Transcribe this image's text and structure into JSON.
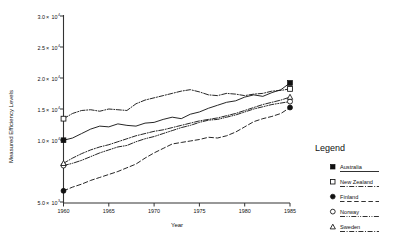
{
  "chart_data": {
    "type": "line",
    "title": "",
    "xlabel": "Year",
    "ylabel": "Measured Efficiency Levels",
    "xlim": [
      1960,
      1985
    ],
    "ylim": [
      5000,
      30000
    ],
    "grid": false,
    "legend_position": "right-outside",
    "legend_title": "Legend",
    "xticks": [
      "1960",
      "1965",
      "1970",
      "1975",
      "1980",
      "1985"
    ],
    "xtick_values": [
      1960,
      1965,
      1970,
      1975,
      1980,
      1985
    ],
    "yticks": [
      {
        "mantissa": "3.0",
        "times": "×",
        "base": "10",
        "exp": "4",
        "value": 30000
      },
      {
        "mantissa": "2.5",
        "times": "×",
        "base": "10",
        "exp": "4",
        "value": 25000
      },
      {
        "mantissa": "2.0",
        "times": "×",
        "base": "10",
        "exp": "4",
        "value": 20000
      },
      {
        "mantissa": "1.5",
        "times": "×",
        "base": "10",
        "exp": "4",
        "value": 15000
      },
      {
        "mantissa": "1.0",
        "times": "×",
        "base": "10",
        "exp": "4",
        "value": 10000
      },
      {
        "mantissa": "5.0",
        "times": "×",
        "base": "10",
        "exp": "3",
        "value": 5000
      }
    ],
    "x": [
      1960,
      1961,
      1962,
      1963,
      1964,
      1965,
      1966,
      1967,
      1968,
      1969,
      1970,
      1971,
      1972,
      1973,
      1974,
      1975,
      1976,
      1977,
      1978,
      1979,
      1980,
      1981,
      1982,
      1983,
      1984,
      1985
    ],
    "series": [
      {
        "name": "Australia",
        "marker": "filled-square",
        "linestyle": "solid",
        "color": "#1a1a1a",
        "values": [
          13300,
          13600,
          14200,
          14800,
          15200,
          15100,
          15500,
          15300,
          15200,
          15600,
          15700,
          16100,
          16400,
          16200,
          16800,
          17100,
          17600,
          18000,
          18400,
          18600,
          19100,
          19400,
          19200,
          19700,
          20100,
          21000
        ]
      },
      {
        "name": "New Zealand",
        "marker": "open-square",
        "linestyle": "dash-dot",
        "color": "#1a1a1a",
        "values": [
          16200,
          16900,
          17300,
          17400,
          17200,
          17500,
          17400,
          17300,
          18200,
          18700,
          19000,
          19300,
          19600,
          19900,
          20100,
          19800,
          19400,
          19300,
          19600,
          19500,
          19300,
          19500,
          19600,
          19900,
          20000,
          20200
        ]
      },
      {
        "name": "Finland",
        "marker": "filled-circle",
        "linestyle": "dashed",
        "color": "#1a1a1a",
        "values": [
          6500,
          7000,
          7400,
          7900,
          8300,
          8700,
          9100,
          9600,
          10100,
          10900,
          11600,
          12200,
          12800,
          13000,
          13200,
          13400,
          13700,
          13600,
          13900,
          14400,
          15100,
          15800,
          16200,
          16500,
          16900,
          17700
        ]
      },
      {
        "name": "Norway",
        "marker": "open-circle",
        "linestyle": "dash-dot-dot",
        "color": "#1a1a1a",
        "values": [
          9900,
          10200,
          10600,
          11100,
          11600,
          12000,
          12400,
          12600,
          13100,
          13500,
          13800,
          14200,
          14600,
          15000,
          15300,
          15700,
          16000,
          16100,
          16400,
          16700,
          17100,
          17500,
          17800,
          18100,
          18300,
          18500
        ]
      },
      {
        "name": "Sweden",
        "marker": "open-triangle",
        "linestyle": "dash-dot",
        "color": "#1a1a1a",
        "values": [
          10200,
          10900,
          11500,
          12000,
          12400,
          12700,
          13100,
          13500,
          13900,
          14200,
          14500,
          14700,
          15000,
          15300,
          15600,
          15900,
          16100,
          16300,
          16600,
          16900,
          17300,
          17700,
          18100,
          18400,
          18700,
          19100
        ]
      }
    ]
  },
  "legend": {
    "title": "Legend",
    "items": [
      {
        "label": "Australia",
        "marker": "filled-square",
        "linestyle": "solid"
      },
      {
        "label": "New Zealand",
        "marker": "open-square",
        "linestyle": "dash-dot"
      },
      {
        "label": "Finland",
        "marker": "filled-circle",
        "linestyle": "dashed"
      },
      {
        "label": "Norway",
        "marker": "open-circle",
        "linestyle": "dash-dot-dot"
      },
      {
        "label": "Sweden",
        "marker": "open-triangle",
        "linestyle": "dash-dot"
      }
    ]
  }
}
